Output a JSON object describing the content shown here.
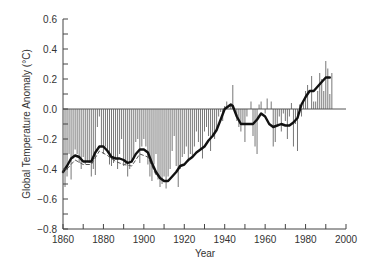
{
  "chart_data": {
    "type": "bar",
    "title": "",
    "xlabel": "Year",
    "ylabel": "Global Temperature Anomaly (°C)",
    "xlim": [
      1860,
      2000
    ],
    "ylim": [
      -0.8,
      0.6
    ],
    "x_ticks": [
      1860,
      1880,
      1900,
      1920,
      1940,
      1960,
      1980,
      2000
    ],
    "x_tick_labels": [
      "1860",
      "1880",
      "1900",
      "1920",
      "1940",
      "1960",
      "1980",
      "2000"
    ],
    "y_ticks": [
      -0.8,
      -0.6,
      -0.4,
      -0.2,
      0.0,
      0.2,
      0.4,
      0.6
    ],
    "y_tick_labels": [
      "−0.8",
      "−0.6",
      "−0.4",
      "−0.2",
      "0.0",
      "0.2",
      "0.4",
      "0.6"
    ],
    "grid": false,
    "legend": null,
    "series": [
      {
        "name": "Annual anomaly",
        "kind": "bar",
        "color": "#777777",
        "x": [
          1861,
          1862,
          1863,
          1864,
          1865,
          1866,
          1867,
          1868,
          1869,
          1870,
          1871,
          1872,
          1873,
          1874,
          1875,
          1876,
          1877,
          1878,
          1879,
          1880,
          1881,
          1882,
          1883,
          1884,
          1885,
          1886,
          1887,
          1888,
          1889,
          1890,
          1891,
          1892,
          1893,
          1894,
          1895,
          1896,
          1897,
          1898,
          1899,
          1900,
          1901,
          1902,
          1903,
          1904,
          1905,
          1906,
          1907,
          1908,
          1909,
          1910,
          1911,
          1912,
          1913,
          1914,
          1915,
          1916,
          1917,
          1918,
          1919,
          1920,
          1921,
          1922,
          1923,
          1924,
          1925,
          1926,
          1927,
          1928,
          1929,
          1930,
          1931,
          1932,
          1933,
          1934,
          1935,
          1936,
          1937,
          1938,
          1939,
          1940,
          1941,
          1942,
          1943,
          1944,
          1945,
          1946,
          1947,
          1948,
          1949,
          1950,
          1951,
          1952,
          1953,
          1954,
          1955,
          1956,
          1957,
          1958,
          1959,
          1960,
          1961,
          1962,
          1963,
          1964,
          1965,
          1966,
          1967,
          1968,
          1969,
          1970,
          1971,
          1972,
          1973,
          1974,
          1975,
          1976,
          1977,
          1978,
          1979,
          1980,
          1981,
          1982,
          1983,
          1984,
          1985,
          1986,
          1987,
          1988,
          1989,
          1990,
          1991,
          1992,
          1993
        ],
        "values": [
          -0.52,
          -0.45,
          -0.3,
          -0.47,
          -0.33,
          -0.27,
          -0.3,
          -0.36,
          -0.4,
          -0.32,
          -0.37,
          -0.35,
          -0.36,
          -0.45,
          -0.4,
          -0.44,
          -0.12,
          -0.05,
          -0.25,
          -0.3,
          -0.25,
          -0.28,
          -0.37,
          -0.38,
          -0.36,
          -0.33,
          -0.4,
          -0.3,
          -0.2,
          -0.38,
          -0.37,
          -0.45,
          -0.4,
          -0.36,
          -0.33,
          -0.22,
          -0.2,
          -0.36,
          -0.25,
          -0.2,
          -0.25,
          -0.37,
          -0.45,
          -0.48,
          -0.37,
          -0.3,
          -0.47,
          -0.52,
          -0.5,
          -0.45,
          -0.53,
          -0.45,
          -0.4,
          -0.28,
          -0.18,
          -0.38,
          -0.52,
          -0.4,
          -0.32,
          -0.3,
          -0.25,
          -0.35,
          -0.3,
          -0.32,
          -0.25,
          -0.15,
          -0.22,
          -0.27,
          -0.33,
          -0.15,
          -0.12,
          -0.18,
          -0.28,
          -0.18,
          -0.2,
          -0.15,
          -0.05,
          -0.02,
          -0.08,
          0.02,
          0.05,
          0.0,
          0.02,
          0.16,
          0.0,
          -0.08,
          -0.12,
          -0.15,
          -0.1,
          -0.22,
          -0.05,
          0.0,
          0.05,
          -0.18,
          -0.25,
          -0.3,
          0.03,
          0.05,
          0.0,
          -0.03,
          0.07,
          0.0,
          0.05,
          -0.25,
          -0.22,
          -0.1,
          -0.05,
          -0.15,
          -0.03,
          -0.08,
          -0.2,
          -0.05,
          0.04,
          -0.25,
          -0.1,
          -0.28,
          0.03,
          -0.05,
          0.05,
          0.12,
          0.16,
          0.0,
          0.22,
          0.05,
          0.05,
          0.12,
          0.24,
          0.2,
          0.12,
          0.32,
          0.27,
          0.1,
          0.24
        ]
      },
      {
        "name": "Smoothed trend",
        "kind": "line",
        "color": "#111111",
        "x": [
          1860,
          1862,
          1864,
          1866,
          1868,
          1870,
          1872,
          1874,
          1876,
          1878,
          1880,
          1882,
          1884,
          1886,
          1888,
          1890,
          1892,
          1894,
          1896,
          1898,
          1900,
          1902,
          1904,
          1906,
          1908,
          1910,
          1912,
          1914,
          1916,
          1918,
          1920,
          1922,
          1924,
          1926,
          1928,
          1930,
          1932,
          1934,
          1936,
          1938,
          1940,
          1942,
          1943,
          1944,
          1946,
          1948,
          1950,
          1952,
          1954,
          1956,
          1958,
          1960,
          1962,
          1964,
          1966,
          1968,
          1970,
          1972,
          1974,
          1976,
          1978,
          1980,
          1982,
          1984,
          1986,
          1988,
          1990,
          1992
        ],
        "values": [
          -0.42,
          -0.38,
          -0.33,
          -0.31,
          -0.32,
          -0.35,
          -0.35,
          -0.35,
          -0.29,
          -0.25,
          -0.25,
          -0.28,
          -0.32,
          -0.33,
          -0.33,
          -0.34,
          -0.36,
          -0.35,
          -0.3,
          -0.27,
          -0.27,
          -0.29,
          -0.36,
          -0.42,
          -0.46,
          -0.48,
          -0.48,
          -0.45,
          -0.42,
          -0.38,
          -0.37,
          -0.34,
          -0.32,
          -0.29,
          -0.27,
          -0.25,
          -0.21,
          -0.18,
          -0.14,
          -0.07,
          0.0,
          0.02,
          0.03,
          0.02,
          -0.05,
          -0.1,
          -0.1,
          -0.1,
          -0.1,
          -0.07,
          -0.03,
          -0.05,
          -0.1,
          -0.12,
          -0.11,
          -0.1,
          -0.11,
          -0.11,
          -0.09,
          -0.06,
          0.03,
          0.08,
          0.12,
          0.12,
          0.15,
          0.18,
          0.21,
          0.21
        ]
      },
      {
        "name": "Alternate smoothing (dashed)",
        "kind": "dashed-line",
        "color": "#555555",
        "x": [
          1862,
          1866,
          1870,
          1874,
          1878,
          1882,
          1886,
          1890,
          1894,
          1898,
          1902,
          1906
        ],
        "values": [
          -0.4,
          -0.34,
          -0.37,
          -0.37,
          -0.28,
          -0.31,
          -0.35,
          -0.37,
          -0.38,
          -0.3,
          -0.32,
          -0.44
        ]
      }
    ]
  }
}
